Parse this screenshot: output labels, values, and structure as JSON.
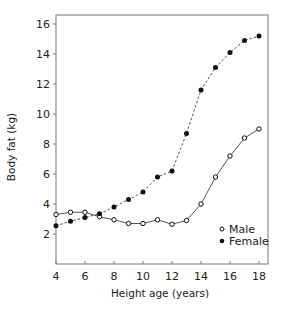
{
  "chart_data": {
    "type": "line",
    "title": "",
    "xlabel": "Height age (years)",
    "ylabel": "Body fat (kg)",
    "xlim": [
      4,
      18.6
    ],
    "ylim": [
      0,
      16.5
    ],
    "xticks": [
      4,
      6,
      8,
      10,
      12,
      14,
      16,
      18
    ],
    "xtick_labels": [
      "4",
      "6",
      "8",
      "10",
      "12",
      "14",
      "16",
      "18"
    ],
    "yticks": [
      2,
      4,
      6,
      8,
      10,
      12,
      14,
      16
    ],
    "ytick_labels": [
      "2",
      "4",
      "6",
      "8",
      "10",
      "12",
      "14",
      "16"
    ],
    "grid": false,
    "legend_position": "bottom-right",
    "x": [
      4,
      5,
      6,
      7,
      8,
      9,
      10,
      11,
      12,
      13,
      14,
      15,
      16,
      17,
      18
    ],
    "series": [
      {
        "name": "Male",
        "marker": "open-circle",
        "line_style": "solid",
        "values": [
          3.3,
          3.45,
          3.45,
          3.15,
          2.95,
          2.7,
          2.7,
          2.95,
          2.65,
          2.9,
          4.0,
          5.8,
          7.2,
          8.4,
          9.0
        ]
      },
      {
        "name": "Female",
        "marker": "filled-circle",
        "line_style": "dashed",
        "values": [
          2.55,
          2.85,
          3.1,
          3.35,
          3.8,
          4.3,
          4.8,
          5.8,
          6.2,
          8.7,
          11.6,
          13.1,
          14.1,
          14.9,
          15.2
        ]
      }
    ]
  },
  "colors": {
    "line": "#555555",
    "marker": "#111111",
    "axis": "#666666"
  }
}
